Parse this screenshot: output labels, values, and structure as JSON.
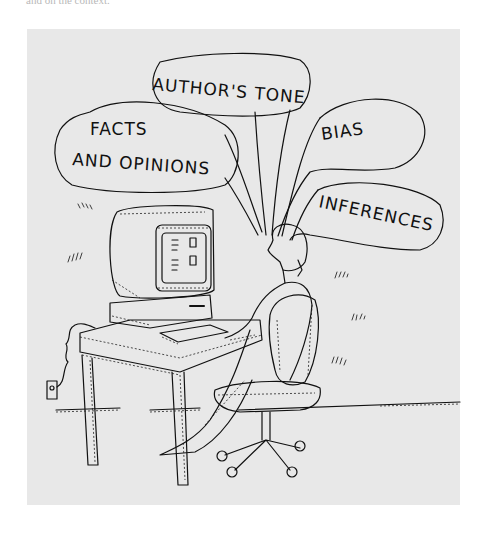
{
  "caption": {
    "partial_text": "and on the context."
  },
  "illustration": {
    "description": "Cartoon of a person seated at a desktop computer with thought bubbles",
    "background_color": "#e8e8e8",
    "bubbles": [
      {
        "label": "FACTS"
      },
      {
        "label": "AND OPINIONS"
      },
      {
        "label": "AUTHOR'S TONE"
      },
      {
        "label": "BIAS"
      },
      {
        "label": "INFERENCES"
      }
    ]
  }
}
